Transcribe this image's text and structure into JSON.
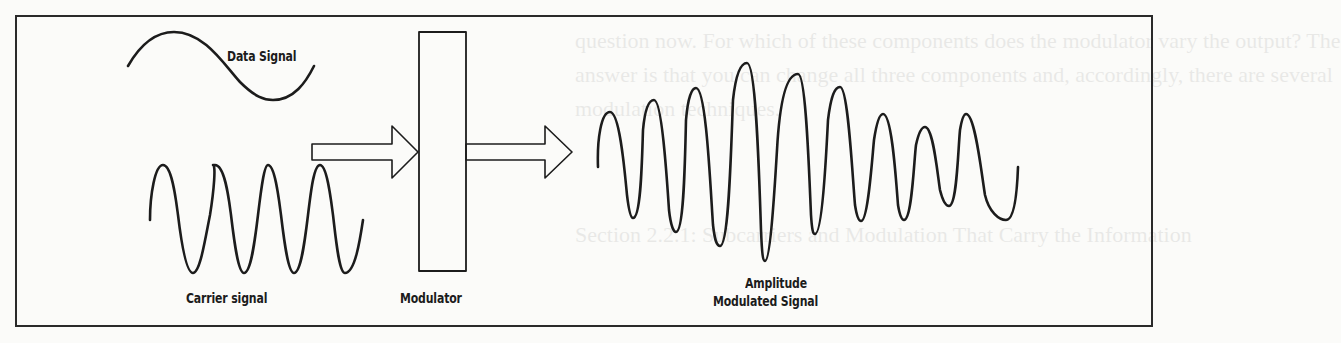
{
  "figure": {
    "type": "amplitude-modulation-block-diagram",
    "labels": {
      "data_signal": "Data Signal",
      "carrier_signal": "Carrier signal",
      "modulator": "Modulator",
      "output_line1": "Amplitude",
      "output_line2": "Modulated Signal"
    },
    "colors": {
      "stroke": "#1c1c1c",
      "background": "#fbfbf9",
      "frame": "#2a2a2a"
    }
  },
  "bleed_through_text": {
    "line1": "question now. For which of these components does the modulator vary the output? The",
    "line2": "answer is that you can change all three components and, accordingly, there are several",
    "line3": "modulation techniques.",
    "line4": "Section 2.2.1: Subcarriers and Modulation That Carry the Information"
  }
}
